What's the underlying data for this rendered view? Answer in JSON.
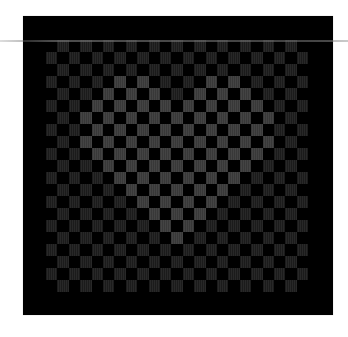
{
  "image": {
    "description": "Dark checkerboard pattern with a brighter heart shape in the center",
    "background_color": "#ffffff",
    "board_color": "#000000",
    "dim_cell_color": "#1b1b1b",
    "bright_cell_color": "#383838"
  },
  "grid": {
    "cols": 23,
    "rows": 21,
    "origin_x": 46,
    "origin_y": 40,
    "cell_w": 11.4,
    "cell_h": 12,
    "pattern": "cells drawn where (row+col) is odd"
  },
  "heart": {
    "rows": [
      {
        "row": 3,
        "cols": [
          6,
          8,
          14,
          16
        ]
      },
      {
        "row": 4,
        "cols": [
          5,
          7,
          9,
          13,
          15,
          17
        ]
      },
      {
        "row": 5,
        "cols": [
          4,
          6,
          8,
          10,
          12,
          14,
          16,
          18
        ]
      },
      {
        "row": 6,
        "cols": [
          3,
          5,
          7,
          9,
          11,
          13,
          15,
          17,
          19
        ]
      },
      {
        "row": 7,
        "cols": [
          4,
          6,
          8,
          10,
          12,
          14,
          16,
          18
        ]
      },
      {
        "row": 8,
        "cols": [
          3,
          5,
          7,
          9,
          11,
          13,
          15,
          17,
          19
        ]
      },
      {
        "row": 9,
        "cols": [
          4,
          6,
          8,
          10,
          12,
          14,
          16,
          18
        ]
      },
      {
        "row": 10,
        "cols": [
          5,
          7,
          9,
          11,
          13,
          15,
          17
        ]
      },
      {
        "row": 11,
        "cols": [
          6,
          8,
          10,
          12,
          14,
          16
        ]
      },
      {
        "row": 12,
        "cols": [
          7,
          9,
          11,
          13,
          15
        ]
      },
      {
        "row": 13,
        "cols": [
          8,
          10,
          12,
          14
        ]
      },
      {
        "row": 14,
        "cols": [
          9,
          11,
          13
        ]
      },
      {
        "row": 15,
        "cols": [
          10,
          12
        ]
      },
      {
        "row": 16,
        "cols": [
          11
        ]
      }
    ]
  }
}
